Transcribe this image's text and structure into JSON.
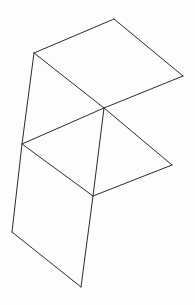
{
  "figure": {
    "kind": "wireframe-line-drawing",
    "canvas": {
      "width": 195,
      "height": 305,
      "background": "#fdfdfd"
    },
    "style": {
      "stroke": "#2b2b2b",
      "stroke_width": 1,
      "fill": "none"
    },
    "vertices": {
      "top_apex": {
        "x": 114,
        "y": 19
      },
      "upper_left": {
        "x": 34,
        "y": 53
      },
      "right_upper": {
        "x": 183,
        "y": 76
      },
      "center": {
        "x": 104,
        "y": 108
      },
      "mid_left": {
        "x": 22,
        "y": 144
      },
      "right_mid": {
        "x": 172,
        "y": 165
      },
      "lower_mid": {
        "x": 93,
        "y": 196
      },
      "bottom_left": {
        "x": 12,
        "y": 232
      },
      "bottom_apex": {
        "x": 81,
        "y": 287
      }
    },
    "faces": [
      {
        "name": "upper-parallelogram",
        "points": "34,53 114,19 183,76 104,108"
      },
      {
        "name": "middle-parallelogram",
        "points": "22,144 104,108 172,165 93,196"
      },
      {
        "name": "lower-parallelogram",
        "points": "12,232 93,196 104,108 22,144"
      }
    ],
    "edges": [
      {
        "name": "upper-left-to-top-apex",
        "points": "34,53 114,19"
      },
      {
        "name": "top-apex-to-right-upper",
        "points": "114,19 183,76"
      },
      {
        "name": "right-upper-to-center",
        "points": "183,76 104,108"
      },
      {
        "name": "center-to-upper-left",
        "points": "104,108 34,53"
      },
      {
        "name": "left-spine",
        "points": "34,53 22,144 12,232"
      },
      {
        "name": "mid-left-to-center",
        "points": "22,144 104,108"
      },
      {
        "name": "center-to-right-mid",
        "points": "104,108 172,165"
      },
      {
        "name": "right-mid-to-lower-mid",
        "points": "172,165 93,196"
      },
      {
        "name": "lower-mid-to-mid-left",
        "points": "93,196 22,144"
      },
      {
        "name": "center-spine",
        "points": "104,108 93,196 81,287"
      },
      {
        "name": "bottom-left-to-bottom-apex",
        "points": "12,232 81,287"
      }
    ]
  }
}
